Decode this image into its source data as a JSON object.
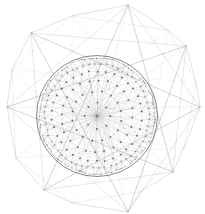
{
  "figure": {
    "title": "Octagram star polygon enclosing triangulated disc graph",
    "type": "line-art-geometric-diagram",
    "canvas": {
      "width": 205,
      "height": 214,
      "background": "#ffffff"
    },
    "colors": {
      "star_stroke": "#9a9a9a",
      "inner_polygon_stroke": "#a8a8a8",
      "circle_stroke": "#6e6e6e",
      "mesh_stroke": "#9d9d9d",
      "rim_mesh_stroke": "#7d7d7d",
      "node_fill": "#4a4a4a"
    },
    "strokes": {
      "star_width": 0.5,
      "inner_polygon_width": 0.45,
      "circle_width": 0.9,
      "mesh_width": 0.35,
      "rim_mesh_width": 0.3
    }
  },
  "star": {
    "name": "octagram",
    "points": 8,
    "center": {
      "x": 100,
      "y": 108
    },
    "outer_radius": 101,
    "inner_radius": 62,
    "rotation_deg": -8,
    "outer_vertices": [
      {
        "x": 128,
        "y": 5
      },
      {
        "x": 186,
        "y": 46
      },
      {
        "x": 200,
        "y": 107
      },
      {
        "x": 173,
        "y": 172
      },
      {
        "x": 128,
        "y": 212
      },
      {
        "x": 44,
        "y": 190
      },
      {
        "x": 7,
        "y": 107
      },
      {
        "x": 31,
        "y": 33
      }
    ],
    "inner_vertices": [
      {
        "x": 168,
        "y": 30
      },
      {
        "x": 196,
        "y": 82
      },
      {
        "x": 184,
        "y": 148
      },
      {
        "x": 140,
        "y": 192
      },
      {
        "x": 72,
        "y": 203
      },
      {
        "x": 16,
        "y": 158
      },
      {
        "x": 12,
        "y": 70
      },
      {
        "x": 72,
        "y": 16
      }
    ]
  },
  "circle": {
    "name": "bounding-disc",
    "center": {
      "x": 97,
      "y": 116
    },
    "radius": 60.5,
    "inner_ring_radius": 53
  },
  "mesh": {
    "description": "dense triangulated graph inside the disc, node density increasing toward the rim",
    "ring_counts": [
      1,
      8,
      16,
      24,
      34,
      56,
      96
    ],
    "ring_radii": [
      0,
      13,
      25,
      36,
      45,
      52,
      58
    ],
    "node_count": 235,
    "node_radius": 0.85,
    "chord_spokes": 16
  },
  "labels": {
    "figure_caption": "",
    "axis": "",
    "legend": ""
  }
}
